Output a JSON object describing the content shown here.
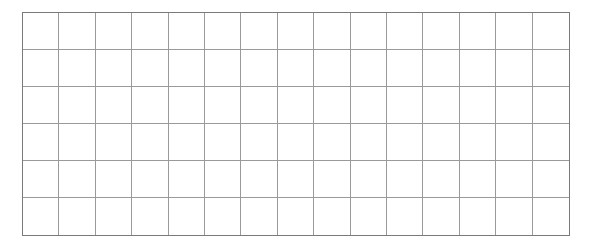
{
  "grid": {
    "rows": 6,
    "columns": 15,
    "line_color": "#9a9a9a",
    "border_color": "#7a7a7a",
    "background": "#ffffff"
  }
}
